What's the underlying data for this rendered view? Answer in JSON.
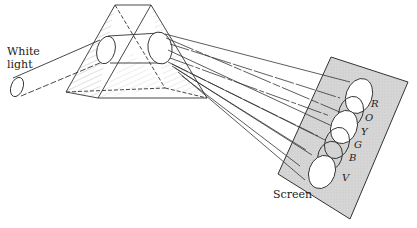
{
  "figure": {
    "type": "prism-dispersion-diagram",
    "labels": {
      "source_line1": "White",
      "source_line2": "light",
      "screen": "Screen"
    },
    "spectrum_bands": [
      {
        "label": "R",
        "name": "red"
      },
      {
        "label": "O",
        "name": "orange"
      },
      {
        "label": "Y",
        "name": "yellow"
      },
      {
        "label": "G",
        "name": "green"
      },
      {
        "label": "B",
        "name": "blue"
      },
      {
        "label": "V",
        "name": "violet"
      }
    ],
    "colors": {
      "line": "#333333",
      "screen_fill": "#d4d4d4",
      "hatch": "#777777",
      "background": "#ffffff"
    }
  }
}
